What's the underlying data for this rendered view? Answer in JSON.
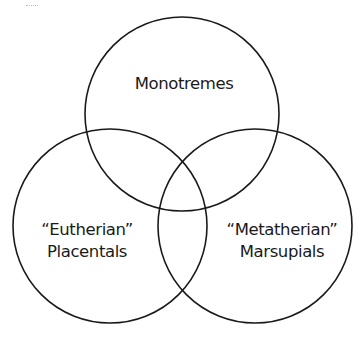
{
  "diagram": {
    "type": "venn",
    "stroke_color": "#1a1a1a",
    "background": "#ffffff",
    "sets": [
      {
        "id": "top",
        "label_lines": [
          "Monotremes"
        ],
        "cx": 182,
        "cy": 114,
        "r": 97
      },
      {
        "id": "left",
        "label_lines": [
          "“Eutherian”",
          "Placentals"
        ],
        "cx": 110,
        "cy": 226,
        "r": 97
      },
      {
        "id": "right",
        "label_lines": [
          "“Metatherian”",
          "Marsupials"
        ],
        "cx": 255,
        "cy": 226,
        "r": 97
      }
    ]
  },
  "labels": {
    "monotremes": "Monotremes",
    "eutherian": "“Eutherian”",
    "placentals": "Placentals",
    "metatherian": "“Metatherian”",
    "marsupials": "Marsupials"
  }
}
